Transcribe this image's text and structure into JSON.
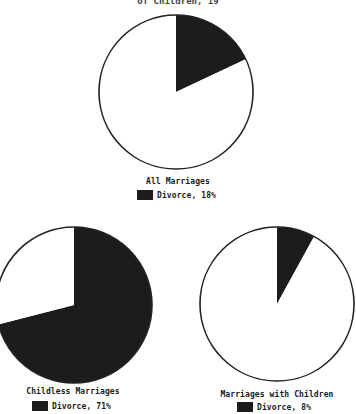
{
  "chart_data": [
    {
      "type": "pie",
      "title": "of Children, 19",
      "label": "All Marriages",
      "legend": "Divorce, 18%",
      "slices": [
        {
          "name": "Divorce",
          "value": 18,
          "color": "#1c1c1c"
        },
        {
          "name": "Other",
          "value": 82,
          "color": "#ffffff"
        }
      ]
    },
    {
      "type": "pie",
      "label": "Childless Marriages",
      "legend": "Divorce, 71%",
      "slices": [
        {
          "name": "Divorce",
          "value": 71,
          "color": "#1c1c1c"
        },
        {
          "name": "Other",
          "value": 29,
          "color": "#ffffff"
        }
      ]
    },
    {
      "type": "pie",
      "label": "Marriages with Children",
      "legend": "Divorce, 8%",
      "slices": [
        {
          "name": "Divorce",
          "value": 8,
          "color": "#1c1c1c"
        },
        {
          "name": "Other",
          "value": 92,
          "color": "#ffffff"
        }
      ]
    }
  ]
}
